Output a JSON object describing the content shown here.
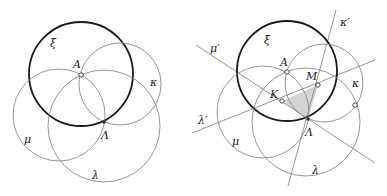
{
  "figures": [
    {
      "name": "left",
      "circles": [
        {
          "id": "xi",
          "label": "ξ",
          "cx": 81,
          "cy": 74,
          "r": 52,
          "style": "thick",
          "label_pos": [
            50,
            47
          ]
        },
        {
          "id": "kappa",
          "label": "κ",
          "cx": 120,
          "cy": 84,
          "r": 41,
          "style": "thin",
          "label_pos": [
            150,
            86
          ]
        },
        {
          "id": "mu",
          "label": "μ",
          "cx": 59,
          "cy": 115,
          "r": 46,
          "style": "thin",
          "label_pos": [
            24,
            143
          ]
        },
        {
          "id": "lambda",
          "label": "λ",
          "cx": 104,
          "cy": 126,
          "r": 56,
          "style": "thin",
          "label_pos": [
            92,
            179
          ]
        }
      ],
      "points": [
        {
          "id": "A",
          "label": "A",
          "x": 81,
          "y": 75,
          "label_pos": [
            73,
            68
          ],
          "style": "open"
        },
        {
          "id": "Lambda",
          "label": "Λ",
          "x": 104,
          "y": 122,
          "label_pos": [
            101,
            139
          ],
          "style": "dot"
        }
      ]
    },
    {
      "name": "right",
      "circles": [
        {
          "id": "xi",
          "label": "ξ",
          "cx": 287,
          "cy": 71,
          "r": 50,
          "style": "thick",
          "label_pos": [
            264,
            44
          ]
        },
        {
          "id": "kappa",
          "label": "κ",
          "cx": 324,
          "cy": 83,
          "r": 39,
          "style": "thin",
          "label_pos": [
            352,
            87
          ]
        },
        {
          "id": "mu",
          "label": "μ",
          "cx": 263,
          "cy": 112,
          "r": 46,
          "style": "thin",
          "label_pos": [
            232,
            145
          ]
        },
        {
          "id": "lambda",
          "label": "λ",
          "cx": 306,
          "cy": 122,
          "r": 54,
          "style": "thin",
          "label_pos": [
            312,
            174
          ]
        }
      ],
      "lines": [
        {
          "id": "mu_prime",
          "label": "μ′",
          "x1": 196,
          "y1": 45,
          "x2": 375,
          "y2": 163,
          "label_pos": [
            210,
            52
          ]
        },
        {
          "id": "lambda_prime",
          "label": "λ′",
          "x1": 192,
          "y1": 133,
          "x2": 375,
          "y2": 60,
          "label_pos": [
            198,
            124
          ]
        },
        {
          "id": "kappa_prime",
          "label": "κ′",
          "x1": 336,
          "y1": 10,
          "x2": 288,
          "y2": 186,
          "label_pos": [
            340,
            26
          ]
        }
      ],
      "triangle": {
        "points": [
          [
            282,
            101
          ],
          [
            318,
            85
          ],
          [
            308,
            119
          ]
        ],
        "fill": "#d4d4d4"
      },
      "points": [
        {
          "id": "A",
          "label": "A",
          "x": 287,
          "y": 72,
          "label_pos": [
            280,
            66
          ],
          "style": "open"
        },
        {
          "id": "M",
          "label": "M",
          "x": 318,
          "y": 85,
          "label_pos": [
            306,
            80
          ],
          "style": "open"
        },
        {
          "id": "K",
          "label": "K",
          "x": 282,
          "y": 101,
          "label_pos": [
            270,
            98
          ],
          "style": "open"
        },
        {
          "id": "Lambda",
          "label": "Λ",
          "x": 308,
          "y": 119,
          "label_pos": [
            305,
            136
          ],
          "style": "dot"
        },
        {
          "id": "P",
          "label": "",
          "x": 355,
          "y": 105,
          "label_pos": [
            0,
            0
          ],
          "style": "open"
        }
      ]
    }
  ]
}
